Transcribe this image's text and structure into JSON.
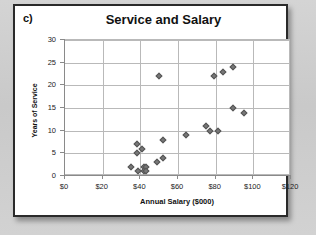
{
  "figure": {
    "panel_label": "c)"
  },
  "chart_data": {
    "type": "scatter",
    "title": "Service and Salary",
    "xlabel": "Annual Salary ($000)",
    "ylabel": "Years of Service",
    "xlim": [
      0,
      120
    ],
    "ylim": [
      0,
      30
    ],
    "xticks": [
      0,
      20,
      40,
      60,
      80,
      100,
      120
    ],
    "xtick_labels": [
      "$0",
      "$20",
      "$40",
      "$60",
      "$80",
      "$100",
      "$120"
    ],
    "yticks": [
      0,
      5,
      10,
      15,
      20,
      25,
      30
    ],
    "ytick_labels": [
      "0",
      "5",
      "10",
      "15",
      "20",
      "25",
      "30"
    ],
    "grid": true,
    "legend": false,
    "marker": "diamond",
    "marker_color": "#777777",
    "points": [
      {
        "x": 35,
        "y": 2
      },
      {
        "x": 38,
        "y": 5
      },
      {
        "x": 38,
        "y": 7
      },
      {
        "x": 39,
        "y": 1
      },
      {
        "x": 41,
        "y": 6
      },
      {
        "x": 42,
        "y": 2
      },
      {
        "x": 42,
        "y": 1
      },
      {
        "x": 43,
        "y": 2
      },
      {
        "x": 43,
        "y": 1
      },
      {
        "x": 49,
        "y": 3
      },
      {
        "x": 50,
        "y": 22
      },
      {
        "x": 52,
        "y": 4
      },
      {
        "x": 52,
        "y": 8
      },
      {
        "x": 64,
        "y": 9
      },
      {
        "x": 75,
        "y": 11
      },
      {
        "x": 77,
        "y": 10
      },
      {
        "x": 79,
        "y": 22
      },
      {
        "x": 81,
        "y": 10
      },
      {
        "x": 84,
        "y": 23
      },
      {
        "x": 89,
        "y": 24
      },
      {
        "x": 89,
        "y": 15
      },
      {
        "x": 95,
        "y": 14
      }
    ]
  }
}
